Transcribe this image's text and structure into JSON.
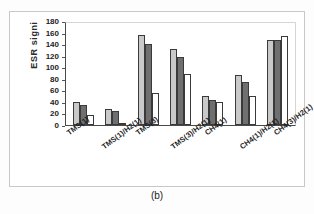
{
  "figure": {
    "caption": "(b)"
  },
  "chart_data": {
    "type": "bar",
    "title": "",
    "xlabel": "",
    "ylabel": "ESR signi",
    "ylim": [
      0,
      180
    ],
    "yticks": [
      180,
      160,
      140,
      120,
      100,
      80,
      60,
      40,
      20,
      0
    ],
    "grid": false,
    "legend": null,
    "categories": [
      "TMS(1)",
      "TMS(1)/H2(1)",
      "TMS(3)",
      "TMS(3)/H2(1)",
      "CH4(1)",
      "CH4(1)/H2(1)",
      "CH4(3)/H2(1)"
    ],
    "series": [
      {
        "name": "series-1",
        "color": "#c9c9c9",
        "values": [
          40,
          28,
          156,
          131,
          51,
          87,
          148
        ]
      },
      {
        "name": "series-2",
        "color": "#6f6f6f",
        "values": [
          35,
          25,
          141,
          117,
          43,
          74,
          148
        ]
      },
      {
        "name": "series-3",
        "color": "#ffffff",
        "values": [
          18,
          3,
          56,
          89,
          39,
          50,
          154
        ]
      }
    ]
  }
}
